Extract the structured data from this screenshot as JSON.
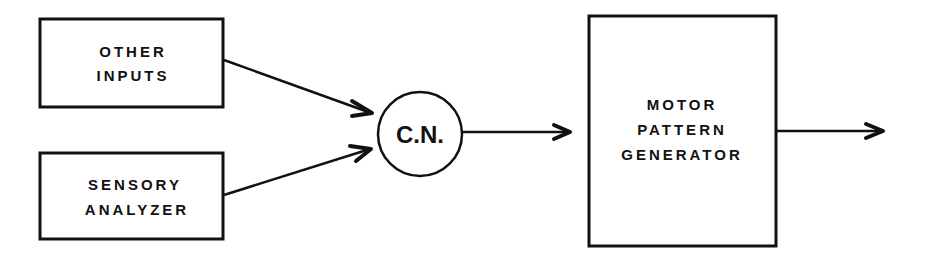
{
  "diagram": {
    "nodes": [
      {
        "id": "other-inputs",
        "lines": [
          "OTHER",
          "INPUTS"
        ]
      },
      {
        "id": "sensory-analyzer",
        "lines": [
          "SENSORY",
          "ANALYZER"
        ]
      },
      {
        "id": "cn",
        "label": "C.N."
      },
      {
        "id": "motor-pattern-generator",
        "lines": [
          "MOTOR",
          "PATTERN",
          "GENERATOR"
        ]
      }
    ],
    "edges": [
      {
        "from": "other-inputs",
        "to": "cn"
      },
      {
        "from": "sensory-analyzer",
        "to": "cn"
      },
      {
        "from": "cn",
        "to": "motor-pattern-generator"
      },
      {
        "from": "motor-pattern-generator",
        "to": "output"
      }
    ]
  }
}
